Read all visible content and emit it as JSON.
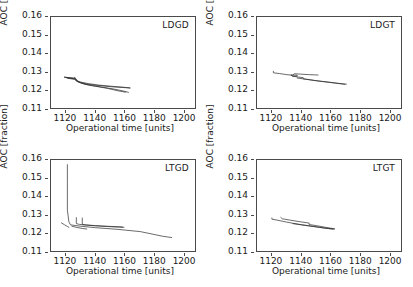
{
  "figure": {
    "axis_label_x": "Operational time [units]",
    "axis_label_y": "AOC [fraction]",
    "xticks": [
      "1120",
      "1140",
      "1160",
      "1180",
      "1200"
    ],
    "yticks": [
      "0.16",
      "0.15",
      "0.14",
      "0.13",
      "0.12",
      "0.11"
    ],
    "line_color": "#2b2b2b",
    "axis_color": "#4a4a4a"
  },
  "panels": [
    {
      "title": "LDGD"
    },
    {
      "title": "LDGT"
    },
    {
      "title": "LTGD"
    },
    {
      "title": "LTGT"
    }
  ],
  "chart_data": [
    {
      "type": "line",
      "title": "LDGD",
      "xlabel": "Operational time [units]",
      "ylabel": "AOC [fraction]",
      "xlim": [
        1110,
        1208
      ],
      "ylim": [
        0.11,
        0.16
      ],
      "xticks": [
        1120,
        1140,
        1160,
        1180,
        1200
      ],
      "yticks": [
        0.11,
        0.12,
        0.13,
        0.14,
        0.15,
        0.16
      ],
      "grid": false,
      "legend": "none",
      "series": [
        {
          "name": "run-1",
          "x": [
            1119,
            1122,
            1125,
            1126,
            1127,
            1130,
            1135,
            1142,
            1150,
            1158,
            1163
          ],
          "y": [
            0.1277,
            0.1274,
            0.1272,
            0.1276,
            0.1258,
            0.125,
            0.1242,
            0.1234,
            0.1228,
            0.1223,
            0.1219
          ]
        },
        {
          "name": "run-2",
          "x": [
            1119,
            1123,
            1126,
            1127,
            1130,
            1136,
            1144,
            1152,
            1160,
            1163
          ],
          "y": [
            0.1276,
            0.1272,
            0.1269,
            0.1255,
            0.1246,
            0.1237,
            0.123,
            0.1224,
            0.122,
            0.1218
          ]
        },
        {
          "name": "run-3",
          "x": [
            1120,
            1124,
            1127,
            1128,
            1132,
            1138,
            1145,
            1152,
            1158,
            1162
          ],
          "y": [
            0.1274,
            0.127,
            0.1266,
            0.1252,
            0.124,
            0.123,
            0.1222,
            0.1213,
            0.1203,
            0.1195
          ]
        },
        {
          "name": "run-4",
          "x": [
            1121,
            1126,
            1129,
            1133,
            1140,
            1148,
            1155,
            1160
          ],
          "y": [
            0.1271,
            0.1264,
            0.125,
            0.1238,
            0.1228,
            0.1216,
            0.1203,
            0.1196
          ]
        }
      ]
    },
    {
      "type": "line",
      "title": "LDGT",
      "xlabel": "Operational time [units]",
      "ylabel": "AOC [fraction]",
      "xlim": [
        1110,
        1208
      ],
      "ylim": [
        0.11,
        0.16
      ],
      "xticks": [
        1120,
        1140,
        1160,
        1180,
        1200
      ],
      "yticks": [
        0.11,
        0.12,
        0.13,
        0.14,
        0.15,
        0.16
      ],
      "grid": false,
      "legend": "none",
      "series": [
        {
          "name": "run-1",
          "x": [
            1121,
            1121,
            1125,
            1130,
            1134,
            1135,
            1139,
            1145,
            1151
          ],
          "y": [
            0.1308,
            0.13,
            0.1296,
            0.129,
            0.1287,
            0.1295,
            0.1293,
            0.129,
            0.1288
          ]
        },
        {
          "name": "run-2",
          "x": [
            1133,
            1134,
            1137,
            1137,
            1134,
            1133
          ],
          "y": [
            0.1288,
            0.1288,
            0.1287,
            0.1282,
            0.1282,
            0.1287
          ]
        },
        {
          "name": "run-3",
          "x": [
            1134,
            1138,
            1141,
            1141,
            1146,
            1154,
            1162,
            1169
          ],
          "y": [
            0.1281,
            0.1277,
            0.1274,
            0.1268,
            0.1262,
            0.1253,
            0.1245,
            0.1238
          ]
        },
        {
          "name": "run-4",
          "x": [
            1137,
            1143,
            1150,
            1158,
            1165,
            1170
          ],
          "y": [
            0.1272,
            0.1265,
            0.1257,
            0.125,
            0.1243,
            0.1239
          ]
        }
      ]
    },
    {
      "type": "line",
      "title": "LTGD",
      "xlabel": "Operational time [units]",
      "ylabel": "AOC [fraction]",
      "xlim": [
        1110,
        1208
      ],
      "ylim": [
        0.11,
        0.16
      ],
      "xticks": [
        1120,
        1140,
        1160,
        1180,
        1200
      ],
      "yticks": [
        0.11,
        0.12,
        0.13,
        0.14,
        0.15,
        0.16
      ],
      "grid": false,
      "legend": "none",
      "series": [
        {
          "name": "spike",
          "x": [
            1121,
            1121,
            1121,
            1122,
            1123,
            1125,
            1130,
            1140,
            1155,
            1170,
            1185,
            1191
          ],
          "y": [
            0.1575,
            0.148,
            0.133,
            0.1268,
            0.1252,
            0.1249,
            0.1244,
            0.1236,
            0.1227,
            0.1215,
            0.119,
            0.1183
          ]
        },
        {
          "name": "run-2",
          "x": [
            1117,
            1119,
            1121,
            1122
          ],
          "y": [
            0.1262,
            0.1252,
            0.1243,
            0.1238
          ]
        },
        {
          "name": "run-3",
          "x": [
            1127,
            1127,
            1129,
            1133,
            1140,
            1148,
            1156,
            1159
          ],
          "y": [
            0.129,
            0.1258,
            0.1254,
            0.125,
            0.1246,
            0.1242,
            0.1239,
            0.1238
          ]
        },
        {
          "name": "run-4",
          "x": [
            1131,
            1131,
            1134,
            1140,
            1150,
            1158
          ],
          "y": [
            0.1288,
            0.1254,
            0.1251,
            0.1247,
            0.1243,
            0.124
          ]
        },
        {
          "name": "run-5",
          "x": [
            1124,
            1127,
            1131,
            1134
          ],
          "y": [
            0.1244,
            0.1238,
            0.1232,
            0.1229
          ]
        }
      ]
    },
    {
      "type": "line",
      "title": "LTGT",
      "xlabel": "Operational time [units]",
      "ylabel": "AOC [fraction]",
      "xlim": [
        1110,
        1208
      ],
      "ylim": [
        0.11,
        0.16
      ],
      "xticks": [
        1120,
        1140,
        1160,
        1180,
        1200
      ],
      "yticks": [
        0.11,
        0.12,
        0.13,
        0.14,
        0.15,
        0.16
      ],
      "grid": false,
      "legend": "none",
      "series": [
        {
          "name": "run-1",
          "x": [
            1120,
            1120,
            1124,
            1130,
            1134,
            1140,
            1148,
            1155,
            1161
          ],
          "y": [
            0.1288,
            0.1282,
            0.1276,
            0.1266,
            0.126,
            0.1252,
            0.1243,
            0.1234,
            0.1228
          ]
        },
        {
          "name": "run-2",
          "x": [
            1126,
            1127,
            1132,
            1139,
            1145,
            1145,
            1150,
            1156,
            1162
          ],
          "y": [
            0.1291,
            0.1284,
            0.1277,
            0.1268,
            0.1261,
            0.1253,
            0.1247,
            0.1238,
            0.123
          ]
        },
        {
          "name": "run-3",
          "x": [
            1134,
            1140,
            1146,
            1152,
            1158,
            1162
          ],
          "y": [
            0.1258,
            0.1251,
            0.1244,
            0.1238,
            0.1232,
            0.1229
          ]
        }
      ]
    }
  ]
}
